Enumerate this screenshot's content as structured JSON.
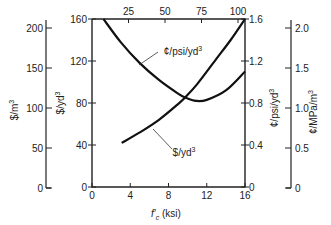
{
  "chart_data": {
    "type": "line",
    "title": "",
    "xlabel": "f'c (ksi)",
    "xlim": [
      0,
      16
    ],
    "x_ticks": [
      0,
      4,
      8,
      12,
      16
    ],
    "top_axis": {
      "label": "",
      "ticks": [
        25,
        50,
        75,
        100
      ]
    },
    "left_axes": [
      {
        "label": "$/m³",
        "ticks": [
          0,
          50,
          100,
          150,
          200
        ]
      },
      {
        "label": "$/yd³",
        "ticks": [
          0,
          40,
          80,
          120,
          160
        ],
        "ylim": [
          0,
          160
        ]
      }
    ],
    "right_axes": [
      {
        "label": "¢/psi/yd³",
        "ticks": [
          0,
          0.4,
          0.8,
          1.2,
          1.6
        ],
        "ylim": [
          0,
          1.6
        ]
      },
      {
        "label": "¢/MPa/m³",
        "ticks": [
          0,
          0.5,
          1.0,
          1.5,
          2.0
        ]
      }
    ],
    "grid": false,
    "series": [
      {
        "name": "$/yd³",
        "axis": "left",
        "x": [
          3.1,
          5,
          7,
          9,
          9.8,
          11,
          13,
          14.5,
          16
        ],
        "values": [
          42,
          52,
          64,
          79,
          86,
          98,
          122,
          140,
          160
        ]
      },
      {
        "name": "¢/psi/yd³",
        "axis": "right",
        "x": [
          1.2,
          3,
          5,
          7,
          9,
          9.8,
          10.9,
          12,
          14,
          16
        ],
        "values": [
          1.6,
          1.38,
          1.18,
          1.02,
          0.89,
          0.85,
          0.82,
          0.83,
          0.92,
          1.1
        ]
      }
    ],
    "annotations": [
      {
        "text": "¢/psi/yd³",
        "points_to": "¢/psi/yd³ curve"
      },
      {
        "text": "$/yd³",
        "points_to": "$/yd³ curve"
      }
    ]
  },
  "labels": {
    "xlabel_f": "f",
    "xlabel_sub": "c",
    "xlabel_rest": " (ksi)",
    "curve_psi": "¢/psi/yd",
    "curve_yd": "$/yd",
    "sup3": "3",
    "left_outer": "$/m",
    "left_inner": "$/yd",
    "right_inner": "¢/psi/yd",
    "right_outer": "¢/MPa/m"
  }
}
